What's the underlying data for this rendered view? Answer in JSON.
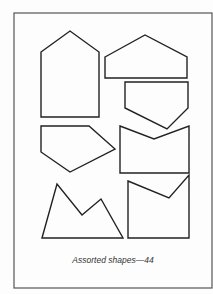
{
  "figure": {
    "caption": "Assorted shapes—44",
    "frame": {
      "x": 14,
      "y": 13,
      "width": 198,
      "height": 275,
      "stroke": "#555555"
    },
    "shape_stroke": "#222222",
    "shapes": [
      {
        "name": "tall-pentagon-house",
        "points": "41,52 70,31 99,52 99,117 41,117"
      },
      {
        "name": "wide-pentagon",
        "points": "105,57 145,35 187,57 187,78 105,78"
      },
      {
        "name": "downward-pentagon",
        "points": "125,82 188,82 188,108 167,129 125,108"
      },
      {
        "name": "left-pentagon",
        "points": "41,126 89,126 115,149 70,172 41,152"
      },
      {
        "name": "notched-rectangle",
        "points": "120,126 154,139 189,126 189,173 120,173"
      },
      {
        "name": "mountain-shape",
        "points": "42,238 57,184 82,215 101,199 123,238"
      },
      {
        "name": "notched-square",
        "points": "128,181 169,198 189,175 189,238 128,238"
      }
    ]
  }
}
